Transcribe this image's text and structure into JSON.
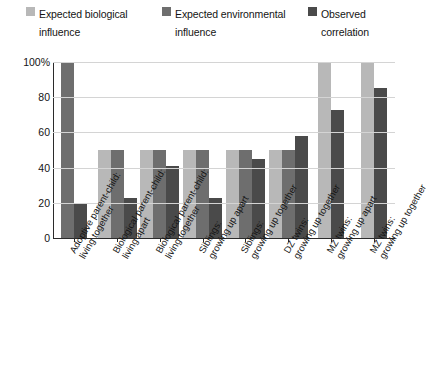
{
  "chart_data": {
    "type": "bar",
    "title": "",
    "xlabel": "",
    "ylabel": "Percent",
    "ylim": [
      0,
      100
    ],
    "yticks": [
      "100%",
      "80",
      "60",
      "40",
      "20",
      "0"
    ],
    "ytick_values": [
      100,
      80,
      60,
      40,
      20,
      0
    ],
    "grid": true,
    "legend_position": "top",
    "categories": [
      "Adoptive parent-child: living together",
      "Biological parent-child: living apart",
      "Biological parent-child: living together",
      "Siblings: growing up apart",
      "Siblings: growing up together",
      "DZ twins: growing up together",
      "MZ twins: growing up apart",
      "MZ twins: growing up together"
    ],
    "series": [
      {
        "name": "Expected biological influence",
        "color": "#b8b8b8",
        "values": [
          null,
          50,
          50,
          50,
          50,
          50,
          100,
          100
        ]
      },
      {
        "name": "Expected environmental influence",
        "color": "#6e6e6e",
        "values": [
          100,
          50,
          50,
          50,
          50,
          50,
          null,
          null
        ]
      },
      {
        "name": "Observed correlation",
        "color": "#4a4a4a",
        "values": [
          20,
          23,
          41,
          23,
          45,
          58,
          73,
          85
        ]
      }
    ]
  },
  "legend": {
    "items": [
      {
        "label_line1": "Expected biological",
        "label_line2": "influence",
        "swatch": "#b8b8b8"
      },
      {
        "label_line1": "Expected environmental",
        "label_line2": "influence",
        "swatch": "#6e6e6e"
      },
      {
        "label_line1": "Observed",
        "label_line2": "correlation",
        "swatch": "#4a4a4a"
      }
    ]
  },
  "axis": {
    "ylabel": "Percent",
    "yticks": [
      "100%",
      "80",
      "60",
      "40",
      "20",
      "0"
    ]
  },
  "xlabels": [
    {
      "line1": "Adoptive parent-child:",
      "line2": "living together"
    },
    {
      "line1": "Biological parent-child:",
      "line2": "living apart"
    },
    {
      "line1": "Biological parent-child:",
      "line2": "living together"
    },
    {
      "line1": "Siblings:",
      "line2": "growing up apart"
    },
    {
      "line1": "Siblings:",
      "line2": "growing up together"
    },
    {
      "line1": "DZ twins:",
      "line2": "growing up together"
    },
    {
      "line1": "MZ twins:",
      "line2": "growing up apart"
    },
    {
      "line1": "MZ twins:",
      "line2": "growing up together"
    }
  ]
}
